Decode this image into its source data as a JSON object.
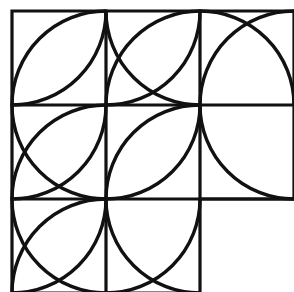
{
  "figure": {
    "title": "Arc tiling puzzle figure",
    "background_color": "#ffffff",
    "stroke_color": "#111111",
    "grid_stroke_width": 3.2,
    "arc_stroke_width": 3.4,
    "cell_size": 94,
    "origin_x": 12,
    "origin_y": 11,
    "columns": 3,
    "rows": 3,
    "missing_cell": "row-3-col-3",
    "grid_outline": [
      "M 12 11 L 294 11 L 294 199 L 200 199 L 200 293 L 12 293 Z"
    ],
    "grid_internal_lines": [
      {
        "name": "vertical-line-1",
        "x1": 106,
        "y1": 11,
        "x2": 106,
        "y2": 293
      },
      {
        "name": "vertical-line-2",
        "x1": 200,
        "y1": 11,
        "x2": 200,
        "y2": 199
      },
      {
        "name": "horizontal-line-1",
        "x1": 12,
        "y1": 105,
        "x2": 294,
        "y2": 105
      },
      {
        "name": "horizontal-line-2",
        "x1": 12,
        "y1": 199,
        "x2": 294,
        "y2": 199
      }
    ],
    "cells": [
      {
        "name": "cell-row1-col1",
        "row": 1,
        "col": 1,
        "x": 12,
        "y": 11,
        "arcs": [
          {
            "name": "arc-center-top-left",
            "center": "top-left",
            "cx": 12,
            "cy": 11
          },
          {
            "name": "arc-center-bottom-right",
            "center": "bottom-right",
            "cx": 106,
            "cy": 105
          }
        ]
      },
      {
        "name": "cell-row1-col2",
        "row": 1,
        "col": 2,
        "x": 106,
        "y": 11,
        "arcs": [
          {
            "name": "arc-center-top-left",
            "center": "top-left",
            "cx": 106,
            "cy": 11
          },
          {
            "name": "arc-center-bottom-right",
            "center": "bottom-right",
            "cx": 200,
            "cy": 105
          },
          {
            "name": "arc-center-top-right",
            "center": "top-right",
            "cx": 200,
            "cy": 11
          }
        ]
      },
      {
        "name": "cell-row1-col3",
        "row": 1,
        "col": 3,
        "x": 200,
        "y": 11,
        "arcs": [
          {
            "name": "arc-center-bottom-left",
            "center": "bottom-left",
            "cx": 200,
            "cy": 105
          },
          {
            "name": "arc-center-bottom-right",
            "center": "bottom-right",
            "cx": 294,
            "cy": 105
          }
        ]
      },
      {
        "name": "cell-row2-col1",
        "row": 2,
        "col": 1,
        "x": 12,
        "y": 105,
        "arcs": [
          {
            "name": "arc-center-top-left",
            "center": "top-left",
            "cx": 12,
            "cy": 105
          },
          {
            "name": "arc-center-top-right",
            "center": "top-right",
            "cx": 106,
            "cy": 105
          },
          {
            "name": "arc-center-bottom-right",
            "center": "bottom-right",
            "cx": 106,
            "cy": 199
          }
        ]
      },
      {
        "name": "cell-row2-col2",
        "row": 2,
        "col": 2,
        "x": 106,
        "y": 105,
        "arcs": [
          {
            "name": "arc-center-top-left",
            "center": "top-left",
            "cx": 106,
            "cy": 105
          },
          {
            "name": "arc-center-bottom-right",
            "center": "bottom-right",
            "cx": 200,
            "cy": 199
          }
        ]
      },
      {
        "name": "cell-row2-col3",
        "row": 2,
        "col": 3,
        "x": 200,
        "y": 105,
        "arcs": [
          {
            "name": "arc-center-top-right",
            "center": "top-right",
            "cx": 294,
            "cy": 105
          }
        ]
      },
      {
        "name": "cell-row3-col1",
        "row": 3,
        "col": 1,
        "x": 12,
        "y": 199,
        "arcs": [
          {
            "name": "arc-center-top-left",
            "center": "top-left",
            "cx": 12,
            "cy": 199
          },
          {
            "name": "arc-center-bottom-right",
            "center": "bottom-right",
            "cx": 106,
            "cy": 293
          },
          {
            "name": "arc-center-top-right",
            "center": "top-right",
            "cx": 106,
            "cy": 199
          }
        ]
      },
      {
        "name": "cell-row3-col2",
        "row": 3,
        "col": 2,
        "x": 106,
        "y": 199,
        "arcs": [
          {
            "name": "arc-center-top-left",
            "center": "top-left",
            "cx": 106,
            "cy": 199
          },
          {
            "name": "arc-center-top-right",
            "center": "top-right",
            "cx": 200,
            "cy": 199
          }
        ]
      }
    ]
  }
}
